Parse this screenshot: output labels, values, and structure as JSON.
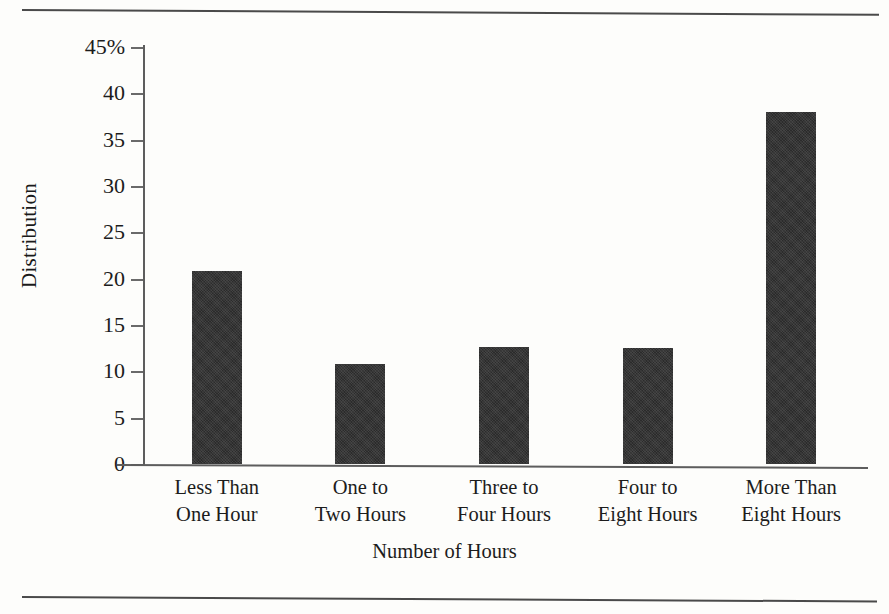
{
  "chart_data": {
    "type": "bar",
    "title": "",
    "xlabel": "Number of Hours",
    "ylabel": "Distribution",
    "categories": [
      "Less Than\nOne Hour",
      "One to\nTwo Hours",
      "Three to\nFour Hours",
      "Four to\nEight Hours",
      "More Than\nEight Hours"
    ],
    "category_lines": [
      [
        "Less Than",
        "One Hour"
      ],
      [
        "One to",
        "Two Hours"
      ],
      [
        "Three to",
        "Four Hours"
      ],
      [
        "Four to",
        "Eight Hours"
      ],
      [
        "More Than",
        "Eight Hours"
      ]
    ],
    "values": [
      20.8,
      10.8,
      12.6,
      12.5,
      38.0
    ],
    "ylim": [
      0,
      45
    ],
    "ytick_values": [
      0,
      5,
      10,
      15,
      20,
      25,
      30,
      35,
      40,
      45
    ],
    "ytick_labels": [
      "0",
      "5",
      "10",
      "15",
      "20",
      "25",
      "30",
      "35",
      "40",
      "45%"
    ],
    "grid": false,
    "legend": null,
    "bar_color": "#2b2b2b",
    "axis_color": "#5d5d5d",
    "background_color": "#fdfdfb"
  }
}
